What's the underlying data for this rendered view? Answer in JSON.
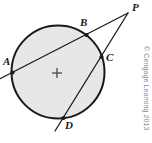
{
  "figure": {
    "name": "circle-with-two-secants-from-external-point",
    "canvas": {
      "width": 152,
      "height": 143
    },
    "credit": "© Cengage Learning 2013",
    "colors": {
      "stroke": "#1a1a1a",
      "circle_fill": "#e7e7e7",
      "circle_stroke": "#1a1a1a",
      "label_color": "#1a1a1a",
      "credit_color": "#8d8d8d"
    },
    "circle": {
      "cx": 58,
      "cy": 72,
      "r": 46.5
    },
    "center_mark": {
      "symbol": "plus",
      "x": 57,
      "y": 73,
      "size": 10
    },
    "points": [
      {
        "id": "A",
        "label": "A",
        "x": 12.5,
        "y": 72.5,
        "dot": true,
        "label_x": 3,
        "label_y": 56
      },
      {
        "id": "B",
        "label": "B",
        "x": 86.5,
        "y": 35.0,
        "dot": true,
        "label_x": 80,
        "label_y": 17
      },
      {
        "id": "C",
        "label": "C",
        "x": 101.5,
        "y": 57.0,
        "dot": true,
        "label_x": 106,
        "label_y": 52
      },
      {
        "id": "D",
        "label": "D",
        "x": 63.5,
        "y": 118.0,
        "dot": true,
        "label_x": 65,
        "label_y": 120
      },
      {
        "id": "P",
        "label": "P",
        "x": 128.0,
        "y": 13.0,
        "dot": false,
        "label_x": 132,
        "label_y": 2
      }
    ],
    "segments": [
      {
        "name": "secant-A-B-P",
        "x1": 0.5,
        "y1": 78.5,
        "x2": 128.0,
        "y2": 13.0
      },
      {
        "name": "secant-D-C-P",
        "x1": 55.0,
        "y1": 131.0,
        "x2": 128.0,
        "y2": 13.0
      }
    ]
  }
}
